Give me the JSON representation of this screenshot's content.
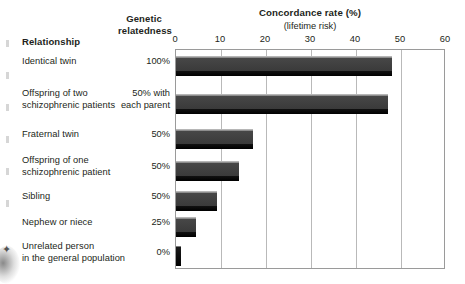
{
  "table": {
    "header_relationship": "Relationship",
    "header_genetic_line1": "Genetic",
    "header_genetic_line2": "relatedness"
  },
  "chart_data": {
    "type": "bar",
    "orientation": "horizontal",
    "title": "Concordance rate (%)",
    "subtitle": "(lifetime risk)",
    "xlabel": "",
    "ylabel": "",
    "xlim": [
      0,
      60
    ],
    "xticks": [
      0,
      10,
      20,
      30,
      40,
      50,
      60
    ],
    "xtick_labels": [
      "0",
      "10",
      "20",
      "30",
      "40",
      "50",
      "60"
    ],
    "grid": true,
    "legend": "none",
    "categories": [
      "Identical twin",
      "Offspring of two schizophrenic patients",
      "Fraternal twin",
      "Offspring of one schizophrenic patient",
      "Sibling",
      "Nephew or niece",
      "Unrelated person in the general population"
    ],
    "genetic_relatedness": [
      "100%",
      "50% with each parent",
      "50%",
      "50%",
      "50%",
      "25%",
      "0%"
    ],
    "values": [
      48,
      47,
      17,
      14,
      9,
      4.5,
      1
    ]
  },
  "rows": [
    {
      "label_lines": [
        "Identical twin"
      ],
      "genetic_lines": [
        "100%"
      ],
      "value": 48
    },
    {
      "label_lines": [
        "Offspring of two",
        "schizophrenic patients"
      ],
      "genetic_lines": [
        "50% with",
        "each parent"
      ],
      "value": 47
    },
    {
      "label_lines": [
        "Fraternal twin"
      ],
      "genetic_lines": [
        "50%"
      ],
      "value": 17
    },
    {
      "label_lines": [
        "Offspring of one",
        "schizophrenic patient"
      ],
      "genetic_lines": [
        "50%"
      ],
      "value": 14
    },
    {
      "label_lines": [
        "Sibling"
      ],
      "genetic_lines": [
        "50%"
      ],
      "value": 9
    },
    {
      "label_lines": [
        "Nephew or niece"
      ],
      "genetic_lines": [
        "25%"
      ],
      "value": 4.5
    },
    {
      "label_lines": [
        "Unrelated person",
        "in the general population"
      ],
      "genetic_lines": [
        "0%"
      ],
      "value": 1
    }
  ],
  "colors": {
    "bar_fill": "#3a3a3a",
    "bar_highlight": "#b6b6b6",
    "bar_shadow": "#000000",
    "gridline": "#b9b9b9",
    "frame": "#9a9a9a",
    "text": "#231f20",
    "background": "#ffffff"
  },
  "layout": {
    "plot_left_px": 175,
    "plot_width_px": 270,
    "plot_top_px": 49,
    "plot_height_px": 220,
    "row_tops_px": [
      55,
      93,
      128,
      160,
      190,
      216,
      245
    ],
    "bar_height_px": 20
  }
}
